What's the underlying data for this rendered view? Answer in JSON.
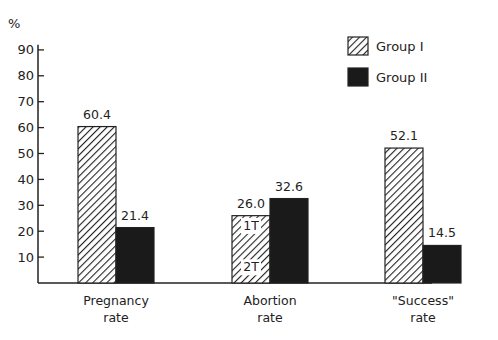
{
  "chart_data": {
    "type": "bar",
    "title": "",
    "xlabel": "",
    "ylabel": "%",
    "ylim": [
      0,
      90
    ],
    "yticks": [
      10,
      20,
      30,
      40,
      50,
      60,
      70,
      80,
      90
    ],
    "grid": false,
    "legend_position": "top-right",
    "categories": [
      "Pregnancy\nrate",
      "Abortion\nrate",
      "\"Success\"\nrate"
    ],
    "category_lines": [
      [
        "Pregnancy",
        "rate"
      ],
      [
        "Abortion",
        "rate"
      ],
      [
        "\"Success\"",
        "rate"
      ]
    ],
    "series": [
      {
        "name": "Group I",
        "pattern": "diagonal-hatch",
        "values": [
          60.4,
          26.0,
          52.1
        ],
        "labels": [
          "60.4",
          "26.0",
          "52.1"
        ]
      },
      {
        "name": "Group II",
        "pattern": "solid-black",
        "values": [
          21.4,
          32.6,
          14.5
        ],
        "labels": [
          "21.4",
          "32.6",
          "14.5"
        ]
      }
    ],
    "annotations": [
      {
        "text": "1T",
        "location": "Group I Abortion bar, upper"
      },
      {
        "text": "2T",
        "location": "Group I Abortion bar, lower"
      }
    ]
  },
  "colors": {
    "axis": "#222222",
    "group_ii_fill": "#1a1a1a",
    "hatch": "#222222",
    "background": "#ffffff"
  }
}
